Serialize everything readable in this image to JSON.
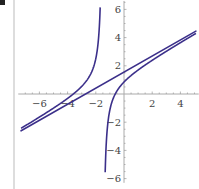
{
  "chart_data": {
    "type": "line",
    "title": "",
    "xlabel": "",
    "ylabel": "",
    "xlim": [
      -7.5,
      5.3
    ],
    "ylim": [
      -6.3,
      6.6
    ],
    "x_ticks": [
      -6,
      -4,
      -2,
      2,
      4
    ],
    "x_tick_labels": [
      "−6",
      "−4",
      "−2",
      "2",
      "4"
    ],
    "y_ticks": [
      6,
      4,
      2,
      -2,
      -4,
      -6
    ],
    "y_tick_labels": [
      "6",
      "4",
      "2",
      "−2",
      "−4",
      "−6"
    ],
    "grid": false,
    "legend": null,
    "series": [
      {
        "name": "asymptote",
        "kind": "line",
        "slope": 0.57,
        "intercept": 1.55,
        "x_range": [
          -7.3,
          5.1
        ],
        "color": "#3b2f8a"
      },
      {
        "name": "rational-function",
        "kind": "rational",
        "slope": 0.57,
        "intercept": 1.55,
        "pole": -1.5,
        "coefficient": 1.05,
        "x_range": [
          -7.3,
          5.1
        ],
        "color": "#3b2f8a"
      }
    ],
    "vertical_asymptote_x": -1.5
  }
}
